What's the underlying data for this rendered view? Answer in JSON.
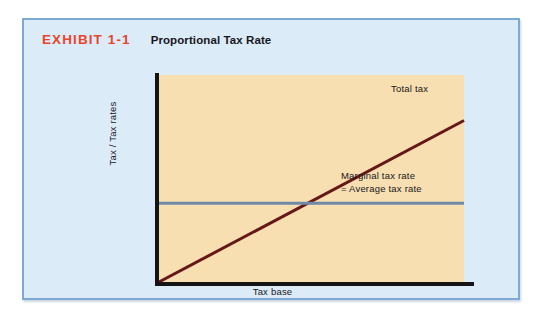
{
  "exhibit": {
    "number": "EXHIBIT 1-1",
    "title": "Proportional Tax Rate",
    "number_color": "#e8452c",
    "card_background": "#dcebf8",
    "card_border_color": "#7ea9d2"
  },
  "chart_data": {
    "type": "line",
    "title": "Proportional Tax Rate",
    "xlabel": "Tax base",
    "ylabel": "Tax / Tax rates",
    "xlim": [
      0,
      100
    ],
    "ylim": [
      0,
      100
    ],
    "grid": false,
    "legend": "none",
    "plot_background": "#f8dfb1",
    "axis_color": "#141414",
    "series": [
      {
        "name": "Total tax",
        "color": "#661717",
        "style": "solid",
        "width": 3,
        "x": [
          0,
          100
        ],
        "values": [
          0,
          78
        ],
        "label": "Total tax",
        "label_x": 76,
        "label_y": 87
      },
      {
        "name": "Marginal tax rate = Average tax rate",
        "color": "#6d8ba9",
        "style": "solid",
        "width": 3,
        "x": [
          0,
          100
        ],
        "values": [
          38,
          38
        ],
        "label": "Marginal tax rate\n= Average tax rate",
        "label_x": 60,
        "label_y": 31
      }
    ],
    "annotations": [
      {
        "text": "Total tax",
        "x": 76,
        "y": 87
      },
      {
        "text": "Marginal tax rate",
        "x": 60,
        "y": 33
      },
      {
        "text": "= Average tax rate",
        "x": 60,
        "y": 27
      }
    ]
  },
  "labels": {
    "total_tax": "Total tax",
    "marginal_rate_line1": "Marginal tax rate",
    "marginal_rate_line2": "= Average tax rate",
    "y_axis": "Tax / Tax rates",
    "x_axis": "Tax base"
  }
}
